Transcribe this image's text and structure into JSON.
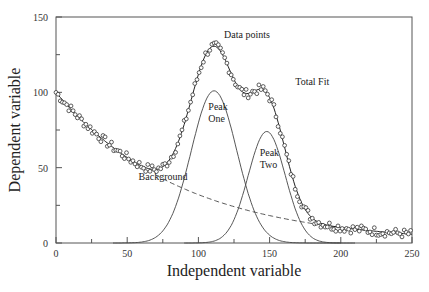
{
  "chart_data": {
    "type": "scatter",
    "title": "",
    "xlabel": "Independent variable",
    "ylabel": "Dependent variable",
    "xlim": [
      0,
      250
    ],
    "ylim": [
      0,
      150
    ],
    "xticks": [
      0,
      50,
      100,
      150,
      200,
      250
    ],
    "yticks": [
      0,
      50,
      100,
      150
    ],
    "minor_xticks": [
      25,
      75,
      125,
      175,
      225
    ],
    "minor_yticks": [
      25,
      75,
      125
    ],
    "grid": false,
    "legend": "none",
    "components": {
      "background": {
        "type": "exponential",
        "amplitude": 100,
        "decay": 88,
        "dashed_from": 70,
        "dashed_to": 200
      },
      "peak_one": {
        "type": "gaussian",
        "center": 111,
        "height": 101,
        "sigma": 16
      },
      "peak_two": {
        "type": "gaussian",
        "center": 148,
        "height": 74,
        "sigma": 13
      }
    },
    "series": [
      {
        "name": "Data points",
        "style": "open-circles",
        "x_step": 1.5,
        "noise": 3
      },
      {
        "name": "Total Fit",
        "style": "solid-line"
      },
      {
        "name": "Peak One",
        "style": "solid-line"
      },
      {
        "name": "Peak Two",
        "style": "solid-line"
      },
      {
        "name": "Background",
        "style": "dashed-line"
      }
    ],
    "annotations": [
      {
        "text": "Data points",
        "x": 118,
        "y": 136
      },
      {
        "text": "Total Fit",
        "x": 168,
        "y": 105
      },
      {
        "text": "Peak",
        "x": 107,
        "y": 88
      },
      {
        "text": "One",
        "x": 107,
        "y": 80
      },
      {
        "text": "Peak",
        "x": 143,
        "y": 58
      },
      {
        "text": "Two",
        "x": 143,
        "y": 50
      },
      {
        "text": "Background",
        "x": 58,
        "y": 42
      }
    ]
  },
  "labels": {
    "xlabel": "Independent variable",
    "ylabel": "Dependent variable"
  }
}
